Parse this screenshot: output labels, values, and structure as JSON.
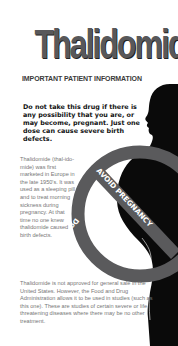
{
  "document": {
    "title": "Thalidomide",
    "subtitle": "IMPORTANT PATIENT INFORMATION",
    "warning": "Do not take this drug if there is any possibility that you are, or may become, pregnant. Just one dose can cause severe birth defects.",
    "paragraph1": "Thalidomide (thal-ido-mide) was first marketed in Europe in the late 1950's. It was used as a sleeping pill and to treat morning sickness during pregnancy. At that time no one knew thalidomide caused birth defects.",
    "paragraph2": "Thalidomide is not approved for general sale in the United States. However, the Food and Drug Administration allows it to be used in studies (such as this one). These are studies of certain severe or life threatening diseases where there may be no other treatment."
  },
  "graphic": {
    "description": "Silhouette of pregnant woman in profile with prohibition circle",
    "band_text_diagonal": "AVOID PREGNANCY",
    "ring_text": "Do Not Take During Pregnancy!",
    "colors": {
      "silhouette": "#0a0a0a",
      "ring": "#5a5a5c",
      "band_text": "#ffffff",
      "title": "#58585a"
    }
  }
}
